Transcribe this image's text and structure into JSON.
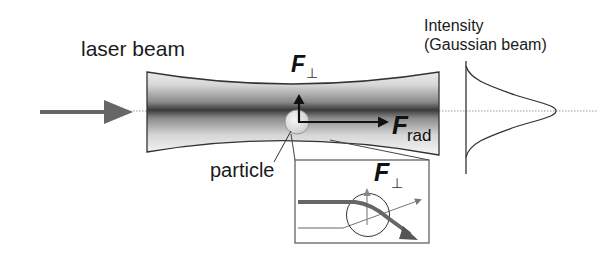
{
  "figure": {
    "type": "optical-trapping-diagram",
    "labels": {
      "laser_beam": "laser beam",
      "intensity_line1": "Intensity",
      "intensity_line2": "(Gaussian beam)",
      "particle": "particle"
    },
    "forces": {
      "perpendicular": {
        "symbol": "F",
        "subscript": "⊥"
      },
      "radiation": {
        "symbol": "F",
        "subscript": "rad"
      },
      "inset_perpendicular": {
        "symbol": "F",
        "subscript": "⊥"
      }
    },
    "colors": {
      "outline": "#333333",
      "beam_core": "#3a3a3a",
      "beam_edge": "#ffffff",
      "incident_arrow": "#666666",
      "axis_dotted": "#999999",
      "particle_fill": "#e6e6e6",
      "inset_ray": "#555555"
    },
    "elements": {
      "incident_arrow": "arrow-right-icon",
      "beam": "gaussian-beam-waist",
      "particle": "sphere-particle",
      "intensity_profile": "gaussian-curve",
      "inset": "ray-refraction-inset"
    }
  }
}
